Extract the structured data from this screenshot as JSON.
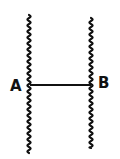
{
  "diagram": {
    "type": "line-segment-between-two-wavy-boundaries",
    "colors": {
      "background": "#ffffff",
      "stroke": "#111111"
    },
    "left_boundary": {
      "style": "wavy",
      "x": 29,
      "y_top": 15,
      "y_bottom": 153
    },
    "right_boundary": {
      "style": "wavy",
      "x": 91,
      "y_top": 18,
      "y_bottom": 148
    },
    "connector": {
      "style": "straight",
      "from": "A",
      "to": "B",
      "x1": 30,
      "x2": 91,
      "y": 85
    },
    "labels": {
      "left": "A",
      "right": "B"
    }
  }
}
